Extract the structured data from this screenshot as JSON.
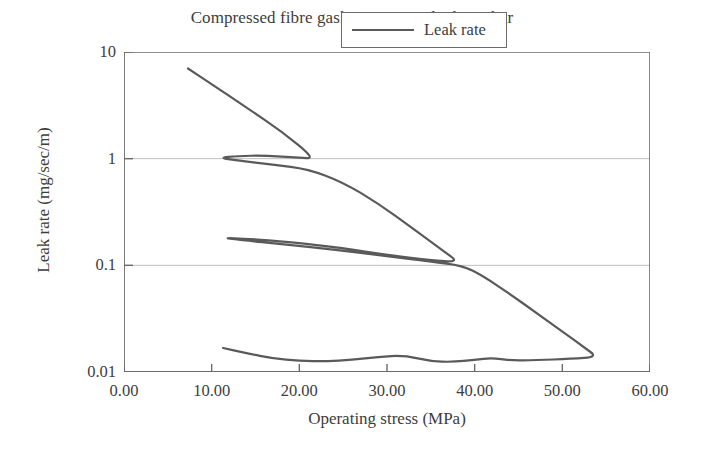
{
  "chart_data": {
    "type": "line",
    "title": "Compressed fibre gasket, 1.5 mm thick, 20 bar",
    "xlabel": "Operating stress (MPa)",
    "ylabel": "Leak rate (mg/sec/m)",
    "xlim": [
      0,
      60
    ],
    "ylim": [
      0.01,
      10
    ],
    "yscale": "log",
    "xscale": "linear",
    "grid": "horizontal-major-only",
    "xticks": [
      0,
      10,
      20,
      30,
      40,
      50,
      60
    ],
    "xticklabels": [
      "0.00",
      "10.00",
      "20.00",
      "30.00",
      "40.00",
      "50.00",
      "60.00"
    ],
    "yticks": [
      10,
      1,
      0.1,
      0.01
    ],
    "yticklabels": [
      "10",
      "1",
      "0.1",
      "0.01"
    ],
    "legend": {
      "position": "upper-right-inside",
      "entries": [
        {
          "label": "Leak rate",
          "color": "#5a5a5a",
          "marker": "none",
          "linestyle": "solid"
        }
      ]
    },
    "series": [
      {
        "name": "Leak rate",
        "color": "#5a5a5a",
        "linewidth": 2.2,
        "description": "Single continuous hysteresis trace with three loading/unloading loops",
        "points": [
          [
            7.3,
            7.0
          ],
          [
            10.0,
            5.0
          ],
          [
            14.0,
            3.0
          ],
          [
            18.0,
            1.8
          ],
          [
            21.8,
            1.0
          ],
          [
            20.0,
            1.02
          ],
          [
            16.0,
            1.07
          ],
          [
            13.0,
            1.06
          ],
          [
            10.8,
            1.02
          ],
          [
            13.0,
            0.96
          ],
          [
            17.0,
            0.88
          ],
          [
            21.0,
            0.8
          ],
          [
            25.0,
            0.6
          ],
          [
            29.0,
            0.38
          ],
          [
            33.0,
            0.22
          ],
          [
            36.5,
            0.135
          ],
          [
            38.2,
            0.107
          ],
          [
            35.0,
            0.112
          ],
          [
            30.0,
            0.125
          ],
          [
            25.0,
            0.145
          ],
          [
            19.0,
            0.165
          ],
          [
            14.0,
            0.178
          ],
          [
            11.2,
            0.181
          ],
          [
            13.5,
            0.172
          ],
          [
            18.0,
            0.158
          ],
          [
            24.0,
            0.14
          ],
          [
            30.0,
            0.122
          ],
          [
            35.0,
            0.108
          ],
          [
            38.6,
            0.1
          ],
          [
            41.0,
            0.079
          ],
          [
            44.0,
            0.054
          ],
          [
            47.0,
            0.036
          ],
          [
            50.0,
            0.024
          ],
          [
            52.5,
            0.017
          ],
          [
            54.0,
            0.0138
          ],
          [
            51.0,
            0.0133
          ],
          [
            47.0,
            0.0129
          ],
          [
            44.0,
            0.0128
          ],
          [
            42.0,
            0.0136
          ],
          [
            40.0,
            0.013
          ],
          [
            37.5,
            0.0124
          ],
          [
            35.0,
            0.0126
          ],
          [
            32.0,
            0.0143
          ],
          [
            29.0,
            0.0139
          ],
          [
            26.0,
            0.013
          ],
          [
            23.0,
            0.0126
          ],
          [
            20.0,
            0.0127
          ],
          [
            17.0,
            0.0134
          ],
          [
            14.0,
            0.015
          ],
          [
            11.3,
            0.0168
          ]
        ]
      }
    ]
  }
}
